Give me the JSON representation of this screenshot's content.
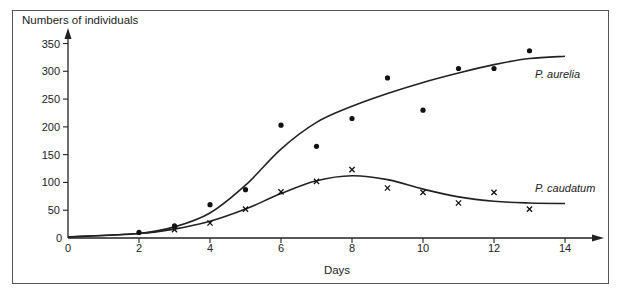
{
  "chart_data": {
    "type": "scatter",
    "title": "",
    "xlabel": "Days",
    "ylabel": "Numbers of individuals",
    "xlim": [
      0,
      14
    ],
    "ylim": [
      0,
      350
    ],
    "x_ticks": [
      0,
      2,
      4,
      6,
      8,
      10,
      12,
      14
    ],
    "y_ticks": [
      0,
      50,
      100,
      150,
      200,
      250,
      300,
      350
    ],
    "grid": false,
    "legend_position": "inline labels at right end of curves",
    "series": [
      {
        "name": "P. aurelia",
        "marker": "dot",
        "points": [
          {
            "x": 2,
            "y": 10
          },
          {
            "x": 3,
            "y": 22
          },
          {
            "x": 4,
            "y": 60
          },
          {
            "x": 5,
            "y": 87
          },
          {
            "x": 6,
            "y": 203
          },
          {
            "x": 7,
            "y": 165
          },
          {
            "x": 8,
            "y": 215
          },
          {
            "x": 9,
            "y": 288
          },
          {
            "x": 10,
            "y": 230
          },
          {
            "x": 11,
            "y": 305
          },
          {
            "x": 12,
            "y": 305
          },
          {
            "x": 13,
            "y": 337
          }
        ],
        "fitted_curve": [
          {
            "x": 0,
            "y": 2
          },
          {
            "x": 2,
            "y": 8
          },
          {
            "x": 3,
            "y": 20
          },
          {
            "x": 4,
            "y": 45
          },
          {
            "x": 5,
            "y": 95
          },
          {
            "x": 6,
            "y": 160
          },
          {
            "x": 7,
            "y": 208
          },
          {
            "x": 8,
            "y": 237
          },
          {
            "x": 9,
            "y": 260
          },
          {
            "x": 10,
            "y": 280
          },
          {
            "x": 11,
            "y": 297
          },
          {
            "x": 12,
            "y": 312
          },
          {
            "x": 13,
            "y": 323
          },
          {
            "x": 14,
            "y": 327
          }
        ]
      },
      {
        "name": "P. caudatum",
        "marker": "x",
        "points": [
          {
            "x": 3,
            "y": 15
          },
          {
            "x": 4,
            "y": 27
          },
          {
            "x": 5,
            "y": 52
          },
          {
            "x": 6,
            "y": 83
          },
          {
            "x": 7,
            "y": 102
          },
          {
            "x": 8,
            "y": 123
          },
          {
            "x": 9,
            "y": 90
          },
          {
            "x": 10,
            "y": 82
          },
          {
            "x": 11,
            "y": 63
          },
          {
            "x": 12,
            "y": 82
          },
          {
            "x": 13,
            "y": 52
          }
        ],
        "fitted_curve": [
          {
            "x": 0,
            "y": 2
          },
          {
            "x": 2,
            "y": 8
          },
          {
            "x": 3,
            "y": 16
          },
          {
            "x": 4,
            "y": 30
          },
          {
            "x": 5,
            "y": 52
          },
          {
            "x": 6,
            "y": 80
          },
          {
            "x": 7,
            "y": 103
          },
          {
            "x": 8,
            "y": 112
          },
          {
            "x": 9,
            "y": 105
          },
          {
            "x": 10,
            "y": 88
          },
          {
            "x": 11,
            "y": 74
          },
          {
            "x": 12,
            "y": 66
          },
          {
            "x": 13,
            "y": 63
          },
          {
            "x": 14,
            "y": 62
          }
        ]
      }
    ]
  },
  "labels": {
    "y_axis_title": "Numbers of individuals",
    "x_axis_title": "Days",
    "series_1_label": "P. aurelia",
    "series_2_label": "P. caudatum"
  },
  "colors": {
    "ink": "#222222",
    "frame": "#555555"
  }
}
